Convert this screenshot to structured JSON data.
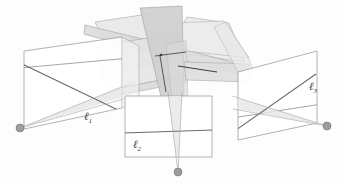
{
  "figure": {
    "background_color": "#fdfdfd",
    "stroke_color": "#8a8a8a",
    "line_color": "#6e6e6e",
    "dark_line_color": "#3c3c3c",
    "point_color": "#9a9a9a",
    "point_stroke_color": "#7a7a7a",
    "band_fill_light": "#ededed",
    "band_fill_mid": "#e0e0e0",
    "band_fill_dark": "#cfcfcf",
    "plane_fill": "#ffffff",
    "labels": [
      {
        "id": "l1",
        "text": "ℓ",
        "subscript": "1",
        "x": 84,
        "y": 110
      },
      {
        "id": "l2",
        "text": "ℓ",
        "subscript": "2",
        "x": 133,
        "y": 138
      },
      {
        "id": "l3",
        "text": "ℓ",
        "subscript": "3",
        "x": 309,
        "y": 80
      }
    ],
    "points": [
      {
        "id": "camera-center-left",
        "cx": 20,
        "cy": 128,
        "r": 4.0
      },
      {
        "id": "camera-center-bottom",
        "cx": 178,
        "cy": 172,
        "r": 4.0
      },
      {
        "id": "camera-center-right",
        "cx": 327,
        "cy": 126,
        "r": 4.0
      }
    ],
    "planes": [
      {
        "id": "image-plane-left",
        "label": "l1"
      },
      {
        "id": "image-plane-bottom",
        "label": "l2"
      },
      {
        "id": "image-plane-right",
        "label": "l3"
      }
    ],
    "bands": [
      {
        "id": "epipolar-band-upper-left"
      },
      {
        "id": "epipolar-band-upper-right"
      },
      {
        "id": "epipolar-band-vertical"
      },
      {
        "id": "epipolar-band-horizontal"
      },
      {
        "id": "epipolar-band-lower-left"
      },
      {
        "id": "epipolar-band-lower-right"
      }
    ]
  }
}
